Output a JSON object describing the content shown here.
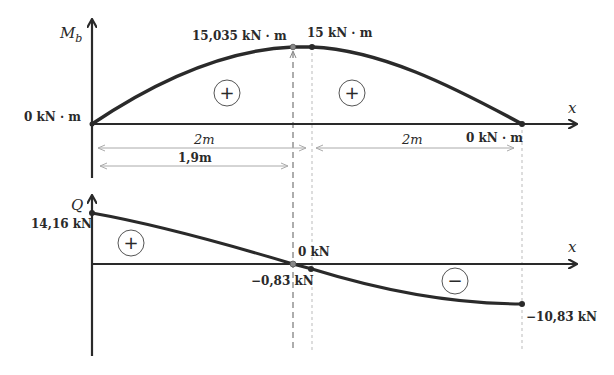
{
  "moment_diagram": {
    "axis_label": "M",
    "axis_label_sub": "b",
    "x_label": "x",
    "start_value": "0 kN · m",
    "peak_value_label": "15,035 kN · m",
    "point_value_label": "15 kN · m",
    "end_value": "0 kN · m",
    "span_left": "2m",
    "span_right": "2m",
    "peak_distance": "1,9m",
    "sign_left": "+",
    "sign_right": "+"
  },
  "shear_diagram": {
    "axis_label": "Q",
    "x_label": "x",
    "start_value": "14,16̄ kN",
    "zero_label": "0 kN",
    "jump_value": "−0,83̄ kN",
    "end_value": "−10,83̄ kN",
    "sign_positive": "+",
    "sign_negative": "−"
  },
  "colors": {
    "curve": "#2a2a2a",
    "axis": "#333333",
    "dim_line": "#aaaaaa",
    "guide": "#999999"
  }
}
